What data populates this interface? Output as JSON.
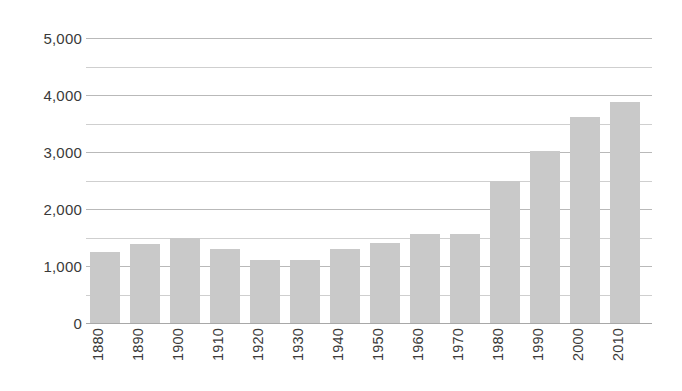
{
  "chart_data": {
    "type": "bar",
    "title": "",
    "subtitle": "",
    "xlabel": "",
    "ylabel": "",
    "categories": [
      "1880",
      "1890",
      "1900",
      "1910",
      "1920",
      "1930",
      "1940",
      "1950",
      "1960",
      "1970",
      "1980",
      "1990",
      "2000",
      "2010"
    ],
    "values": [
      1250,
      1380,
      1500,
      1300,
      1110,
      1100,
      1300,
      1400,
      1560,
      1560,
      2500,
      3020,
      3620,
      3870
    ],
    "series": [
      {
        "name": "",
        "values": [
          1250,
          1380,
          1500,
          1300,
          1110,
          1100,
          1300,
          1400,
          1560,
          1560,
          2500,
          3020,
          3620,
          3870
        ]
      }
    ],
    "ylim": [
      0,
      5000
    ],
    "ytick_values": [
      0,
      500,
      1000,
      1500,
      2000,
      2500,
      3000,
      3500,
      4000,
      4500,
      5000
    ],
    "ytick_labels": [
      "0",
      "",
      "1,000",
      "",
      "2,000",
      "",
      "3,000",
      "",
      "4,000",
      "",
      "5,000"
    ],
    "ytick_labels_major": [
      "0",
      "1,000",
      "2,000",
      "3,000",
      "4,000",
      "5,000"
    ],
    "ytick_values_major": [
      0,
      1000,
      2000,
      3000,
      4000,
      5000
    ],
    "grid": true,
    "grid_major_interval": 1000,
    "grid_minor_interval": 500,
    "legend": false,
    "legend_position": "none",
    "bar_color": "#c9c9c9",
    "grid_color": "#b9b9b9",
    "grid_minor_color": "#cfcfcf",
    "text_color": "#3a3a3a",
    "background_color": "#ffffff",
    "xtick_rotation": 90,
    "annotations": []
  }
}
